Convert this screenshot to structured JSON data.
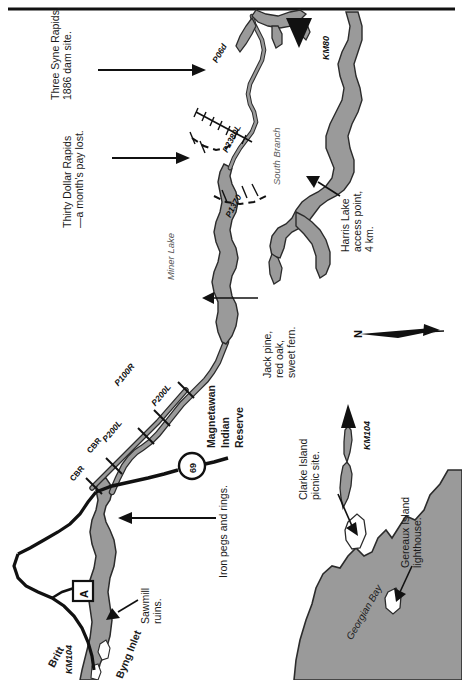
{
  "map": {
    "title": "Magnetawan River canoe route — lower section (Britt / Byng Inlet to KM80)",
    "colors": {
      "water": "#9a9a9a",
      "water_outline": "#3a3a3a",
      "land": "#ffffff",
      "road": "#1a1a1a",
      "text": "#1a1a1a",
      "label_gray": "#5a5a5a"
    },
    "annotations": [
      {
        "id": "three-syne-rapids",
        "text": "Three Syne Rapids,\n1886 dam site.",
        "style": "plain"
      },
      {
        "id": "thirty-dollar-rapids",
        "text": "Thirty Dollar Rapids\n—a month's pay lost.",
        "style": "plain"
      },
      {
        "id": "jack-pine",
        "text": "Jack pine,\nred oak,\nsweet fern.",
        "style": "plain"
      },
      {
        "id": "harris-lake",
        "text": "Harris Lake\naccess point,\n4 km.",
        "style": "plain"
      },
      {
        "id": "iron-pegs",
        "text": "Iron pegs and rings.",
        "style": "plain"
      },
      {
        "id": "sawmill-ruins",
        "text": "Sawmill\nruins.",
        "style": "plain"
      },
      {
        "id": "clarke-island",
        "text": "Clarke Island\npicnic site.",
        "style": "plain"
      },
      {
        "id": "gereaux-island",
        "text": "Gereaux Island\nlighthouse.",
        "style": "plain"
      }
    ],
    "place_labels": [
      {
        "id": "miner-lake",
        "text": "Miner Lake",
        "style": "italic-gray"
      },
      {
        "id": "south-branch",
        "text": "South Branch",
        "style": "italic-gray"
      },
      {
        "id": "georgian-bay",
        "text": "Georgian Bay",
        "style": "italic-dark"
      },
      {
        "id": "byng-inlet",
        "text": "Byng Inlet",
        "style": "bold"
      },
      {
        "id": "britt",
        "text": "Britt",
        "style": "bold"
      }
    ],
    "reserve_label": {
      "line1": "Magnetawan",
      "line2": "Indian",
      "line3": "Reserve"
    },
    "km_markers": [
      {
        "id": "km80",
        "text": "KM80"
      },
      {
        "id": "km104-upper",
        "text": "KM104"
      },
      {
        "id": "km104-lower",
        "text": "KM104"
      }
    ],
    "portages": [
      {
        "id": "p06d",
        "text": "P06d"
      },
      {
        "id": "p2380l",
        "text": "P2380L"
      },
      {
        "id": "p1370",
        "text": "P1370"
      },
      {
        "id": "p100r",
        "text": "P100R"
      },
      {
        "id": "p200l-upper",
        "text": "P200L"
      },
      {
        "id": "p200l-lower",
        "text": "P200L"
      }
    ],
    "rail_labels": [
      {
        "id": "cbr-upper",
        "text": "CBR"
      },
      {
        "id": "cbr-lower",
        "text": "CBR"
      }
    ],
    "highway_shield": {
      "id": "highway-69",
      "number": "69"
    },
    "access_symbol": {
      "id": "access-point-a",
      "letter": "A"
    },
    "north_arrow": {
      "id": "north-arrow",
      "letter": "N"
    }
  }
}
